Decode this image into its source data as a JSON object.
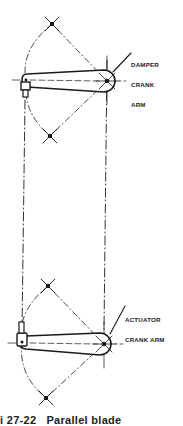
{
  "diagram": {
    "labels": {
      "damper_line1": "DAMPER",
      "damper_line2": "CRANK",
      "damper_line3": "ARM",
      "actuator_line1": "ACTUATOR",
      "actuator_line2": "CRANK ARM"
    },
    "caption": "i 27-22   Parallel blade",
    "colors": {
      "ink": "#1a1a1a",
      "background": "#ffffff"
    },
    "geometry": {
      "damper_crank": {
        "left_pivot": [
          26,
          80
        ],
        "hub": [
          107,
          81
        ],
        "hub_radius": 11,
        "arc_top_marker": [
          52,
          24
        ],
        "arc_bottom_marker": [
          50,
          136
        ]
      },
      "actuator_crank": {
        "left_pivot": [
          22,
          343
        ],
        "hub": [
          104,
          344
        ],
        "hub_radius": 11,
        "arc_top_marker": [
          48,
          286
        ],
        "arc_bottom_marker": [
          46,
          398
        ]
      },
      "linkage_lines_x": [
        26,
        107
      ]
    }
  }
}
